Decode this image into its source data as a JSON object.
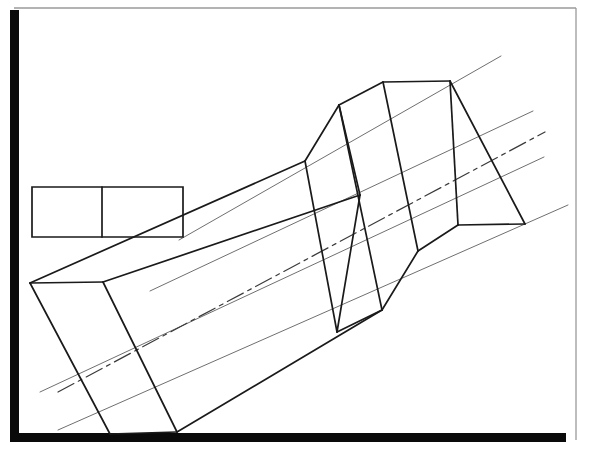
{
  "document": {
    "title": "Isometric technical line drawing",
    "subject": "Rectangular tube with faceted prism section",
    "background_color": "#ffffff"
  },
  "frame": {
    "name": "page-border",
    "top_line": {
      "color": "#9a9a9a",
      "width": 1.3,
      "x1": 14,
      "y1": 8,
      "x2": 576,
      "y2": 8
    },
    "right_line": {
      "color": "#9a9a9a",
      "width": 1.3,
      "x1": 576,
      "y1": 8,
      "x2": 576,
      "y2": 440
    },
    "left_bar": {
      "color": "#0a0a0a",
      "width": 9,
      "x": 10,
      "y": 10,
      "h": 432
    },
    "bottom_bar": {
      "color": "#0a0a0a",
      "height": 9,
      "x": 10,
      "y": 433,
      "w": 556
    }
  },
  "style": {
    "object_line_color": "#1a1a1a",
    "object_line_width": 1.7,
    "guide_line_color": "#6f6f6f",
    "guide_line_width": 1.0,
    "center_line_color": "#3a3a3a",
    "center_line_width": 1.2,
    "center_line_dash": "18,5,4,5"
  },
  "chart_data": {
    "type": "line-drawing",
    "xlim": [
      0,
      589
    ],
    "ylim": [
      0,
      455
    ],
    "grid": false,
    "legend": "none",
    "elements": [
      {
        "name": "orthographic-rectangle",
        "kind": "polyline",
        "role": "object",
        "closed": true,
        "points": "32,187 183,187 183,237 32,237"
      },
      {
        "name": "orthographic-rectangle-divider",
        "kind": "line",
        "role": "object",
        "points": "102,187 102,237"
      },
      {
        "name": "guide-line-upper-outer",
        "kind": "line",
        "role": "guide",
        "points": "179,240 501,56"
      },
      {
        "name": "guide-line-upper-inner",
        "kind": "line",
        "role": "guide",
        "points": "150,291 533,111"
      },
      {
        "name": "guide-line-lower-inner",
        "kind": "line",
        "role": "guide",
        "points": "40,392 544,157"
      },
      {
        "name": "guide-line-lower-outer",
        "kind": "line",
        "role": "guide",
        "points": "58,430 568,205"
      },
      {
        "name": "center-line",
        "kind": "line",
        "role": "center",
        "points": "58,392 545,132"
      },
      {
        "name": "tube-left-end-top-edge",
        "kind": "line",
        "role": "object",
        "points": "30,283 103,282"
      },
      {
        "name": "tube-left-end-left-edge",
        "kind": "line",
        "role": "object",
        "points": "30,283 110,434"
      },
      {
        "name": "tube-left-end-bottom-edge",
        "kind": "line",
        "role": "object",
        "points": "110,434 177,432"
      },
      {
        "name": "tube-left-end-inner-edge",
        "kind": "line",
        "role": "object",
        "points": "103,282 177,432"
      },
      {
        "name": "tube-top-long-edge",
        "kind": "line",
        "role": "object",
        "points": "30,283 305,161"
      },
      {
        "name": "tube-upper-long-edge",
        "kind": "line",
        "role": "object",
        "points": "103,282 360,195"
      },
      {
        "name": "tube-lower-long-edge",
        "kind": "line",
        "role": "object",
        "points": "177,432 382,310"
      },
      {
        "name": "prism-left-apex-upper-edge",
        "kind": "line",
        "role": "object",
        "points": "305,161 339,105"
      },
      {
        "name": "prism-left-apex-lower-edge",
        "kind": "line",
        "role": "object",
        "points": "339,105 360,195"
      },
      {
        "name": "prism-ridge-top-edge",
        "kind": "line",
        "role": "object",
        "points": "339,105 383,82"
      },
      {
        "name": "prism-top-horizontal-edge",
        "kind": "line",
        "role": "object",
        "points": "383,82 450,81"
      },
      {
        "name": "prism-face-rib-1",
        "kind": "line",
        "role": "object",
        "points": "305,161 337,332"
      },
      {
        "name": "prism-face-rib-2",
        "kind": "line",
        "role": "object",
        "points": "339,105 382,310"
      },
      {
        "name": "prism-face-rib-3",
        "kind": "line",
        "role": "object",
        "points": "383,82 418,251"
      },
      {
        "name": "prism-face-rib-4",
        "kind": "line",
        "role": "object",
        "points": "450,81 458,225"
      },
      {
        "name": "prism-bottom-long-edge",
        "kind": "line",
        "role": "object",
        "points": "337,332 382,310"
      },
      {
        "name": "prism-notch-rise-edge",
        "kind": "line",
        "role": "object",
        "points": "382,310 418,251"
      },
      {
        "name": "prism-lower-long-edge",
        "kind": "line",
        "role": "object",
        "points": "418,251 458,225"
      },
      {
        "name": "prism-right-end-horizontal-edge",
        "kind": "line",
        "role": "object",
        "points": "458,225 525,224"
      },
      {
        "name": "prism-right-end-vertical-edge",
        "kind": "line",
        "role": "object",
        "points": "450,81 525,224"
      },
      {
        "name": "prism-right-top-edge",
        "kind": "line",
        "role": "object",
        "points": "360,195 337,332"
      }
    ]
  }
}
